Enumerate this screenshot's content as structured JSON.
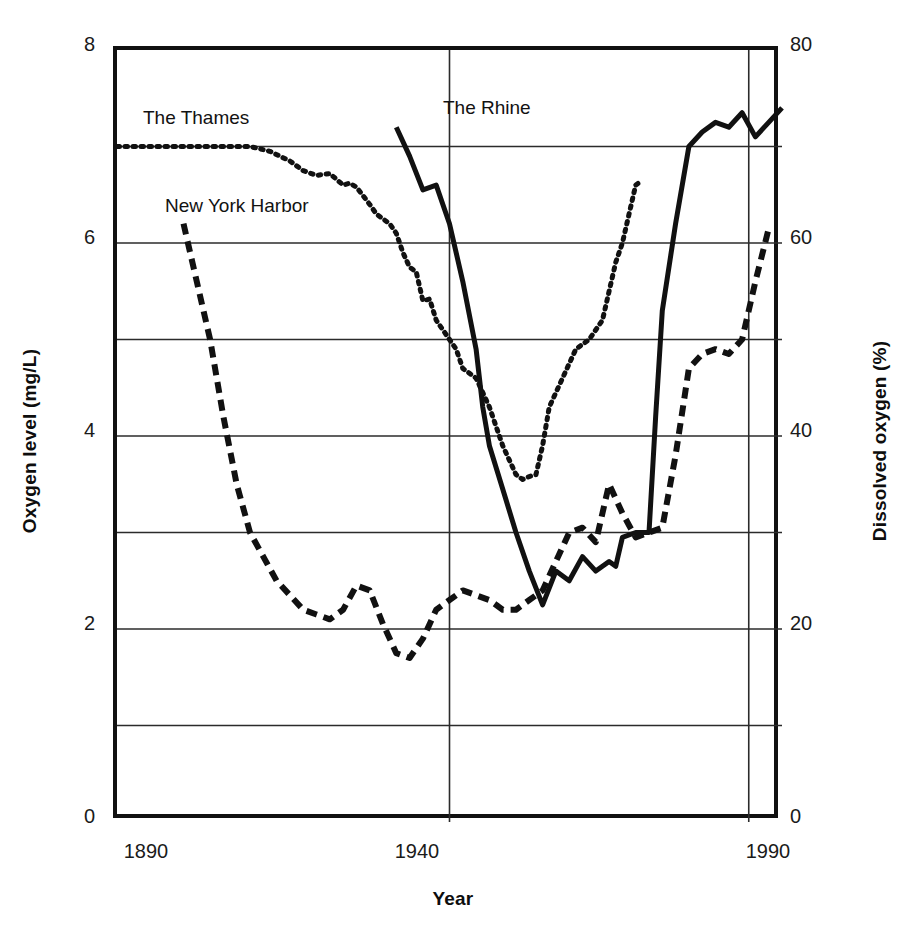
{
  "chart_data": {
    "type": "line",
    "title": "",
    "xlabel": "Year",
    "ylabel": "Oxygen level (mg/L)",
    "ylabel_right": "Dissolved oxygen (%)",
    "xlim": [
      1890,
      1990
    ],
    "ylim": [
      0,
      8
    ],
    "ylim_right": [
      0,
      80
    ],
    "grid": true,
    "legend_position": "inline-annotations",
    "xticks": [
      "1890",
      "1940",
      "1990"
    ],
    "xtick_values": [
      1890,
      1940,
      1990
    ],
    "yticks_left": [
      "0",
      "2",
      "4",
      "6",
      "8"
    ],
    "ytick_values_left": [
      0,
      2,
      4,
      6,
      8
    ],
    "yticks_right": [
      "0",
      "20",
      "40",
      "60",
      "80"
    ],
    "ytick_values_right": [
      0,
      20,
      40,
      60,
      80
    ],
    "gridlines_y": [
      1,
      2,
      3,
      4,
      5,
      6,
      7
    ],
    "gridlines_x": [
      1940,
      1985
    ],
    "series": [
      {
        "name": "The Thames",
        "style": "dotted",
        "color": "#111111",
        "x": [
          1890,
          1895,
          1900,
          1905,
          1908,
          1910,
          1913,
          1916,
          1918,
          1920,
          1922,
          1924,
          1925,
          1926,
          1928,
          1929,
          1930,
          1931,
          1932,
          1933,
          1934,
          1935,
          1936,
          1937,
          1938,
          1939,
          1940,
          1941,
          1942,
          1943,
          1944,
          1945,
          1946,
          1947,
          1948,
          1949,
          1950,
          1951,
          1952,
          1953,
          1954,
          1955,
          1957,
          1959,
          1961,
          1963,
          1964,
          1965,
          1966,
          1967,
          1968,
          1969
        ],
        "y": [
          7.0,
          7.0,
          7.0,
          7.0,
          7.0,
          7.0,
          6.95,
          6.85,
          6.75,
          6.7,
          6.72,
          6.6,
          6.62,
          6.58,
          6.4,
          6.3,
          6.25,
          6.2,
          6.1,
          5.9,
          5.75,
          5.7,
          5.4,
          5.42,
          5.2,
          5.1,
          5.0,
          4.9,
          4.7,
          4.65,
          4.6,
          4.45,
          4.3,
          4.1,
          3.9,
          3.75,
          3.6,
          3.55,
          3.58,
          3.6,
          3.9,
          4.3,
          4.6,
          4.9,
          5.0,
          5.2,
          5.5,
          5.8,
          6.0,
          6.3,
          6.6,
          6.65
        ]
      },
      {
        "name": "New York Harbor",
        "style": "dashed",
        "color": "#111111",
        "x": [
          1900,
          1902,
          1904,
          1906,
          1908,
          1910,
          1912,
          1914,
          1916,
          1918,
          1920,
          1922,
          1924,
          1926,
          1928,
          1930,
          1932,
          1934,
          1936,
          1938,
          1940,
          1942,
          1944,
          1946,
          1948,
          1950,
          1952,
          1954,
          1956,
          1958,
          1960,
          1962,
          1964,
          1966,
          1968,
          1970,
          1972,
          1974,
          1976,
          1978,
          1980,
          1982,
          1984,
          1986,
          1988
        ],
        "y": [
          6.2,
          5.6,
          5.0,
          4.2,
          3.5,
          3.0,
          2.75,
          2.5,
          2.35,
          2.2,
          2.15,
          2.1,
          2.2,
          2.45,
          2.4,
          2.05,
          1.75,
          1.7,
          1.9,
          2.2,
          2.3,
          2.4,
          2.35,
          2.3,
          2.2,
          2.2,
          2.3,
          2.4,
          2.7,
          3.0,
          3.05,
          2.9,
          3.5,
          3.2,
          2.95,
          3.0,
          3.05,
          3.8,
          4.7,
          4.85,
          4.9,
          4.85,
          5.0,
          5.6,
          6.15
        ]
      },
      {
        "name": "The Rhine",
        "style": "solid",
        "color": "#111111",
        "x": [
          1932,
          1934,
          1936,
          1938,
          1940,
          1942,
          1944,
          1945,
          1946,
          1948,
          1950,
          1952,
          1954,
          1956,
          1958,
          1960,
          1962,
          1964,
          1965,
          1966,
          1968,
          1970,
          1971,
          1972,
          1974,
          1976,
          1978,
          1980,
          1982,
          1984,
          1986,
          1988,
          1990
        ],
        "y": [
          7.2,
          6.9,
          6.55,
          6.6,
          6.2,
          5.6,
          4.9,
          4.3,
          3.9,
          3.45,
          3.0,
          2.6,
          2.25,
          2.6,
          2.5,
          2.75,
          2.6,
          2.7,
          2.65,
          2.95,
          3.0,
          3.0,
          4.2,
          5.3,
          6.2,
          7.0,
          7.15,
          7.25,
          7.2,
          7.35,
          7.1,
          7.25,
          7.4
        ]
      }
    ],
    "annotations": [
      {
        "text": "The Thames",
        "x_px": 143,
        "y_px": 110
      },
      {
        "text": "New York Harbor",
        "x_px": 165,
        "y_px": 198
      },
      {
        "text": "The Rhine",
        "x_px": 442,
        "y_px": 100
      }
    ]
  },
  "axes": {
    "left_title": "Oxygen level (mg/L)",
    "right_title": "Dissolved oxygen (%)",
    "x_title": "Year",
    "x_ticks": [
      "1890",
      "1940",
      "1990"
    ],
    "y_ticks_left": [
      "8",
      "6",
      "4",
      "2",
      "0"
    ],
    "y_ticks_right": [
      "80",
      "60",
      "40",
      "20",
      "0"
    ]
  },
  "labels": {
    "thames": "The Thames",
    "harbor": "New York Harbor",
    "rhine": "The Rhine"
  },
  "colors": {
    "ink": "#111111",
    "grid": "#2b2b2b",
    "background": "#ffffff"
  }
}
